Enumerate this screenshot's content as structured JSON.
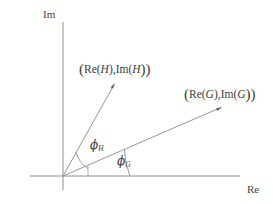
{
  "figure": {
    "width": 273,
    "height": 204,
    "background": "#ffffff",
    "line_color": "#8b8b8b",
    "text_color": "#3c3c3c",
    "axes": {
      "imaginary_label": "Im",
      "real_label": "Re",
      "origin": [
        63,
        176
      ],
      "im_axis": {
        "x": 63,
        "y_top": 22,
        "y_bottom": 190
      },
      "re_axis": {
        "y": 176,
        "x_left": 30,
        "x_right": 240
      }
    },
    "vectors": [
      {
        "name": "H",
        "label_open": "(",
        "label_text": "Re(H),Im(H)",
        "label_re": "Re(",
        "label_var": "H",
        "label_mid": "),Im(",
        "label_close": "))",
        "tip": [
          115,
          83
        ],
        "angle_deg": 61,
        "angle_label": "ϕ",
        "angle_subscript": "H"
      },
      {
        "name": "G",
        "label_open": "(",
        "label_text": "Re(G),Im(G)",
        "label_re": "Re(",
        "label_var": "G",
        "label_mid": "),Im(",
        "label_close": "))",
        "tip": [
          222,
          107
        ],
        "angle_deg": 23.5,
        "angle_label": "ϕ",
        "angle_subscript": "G"
      }
    ]
  }
}
